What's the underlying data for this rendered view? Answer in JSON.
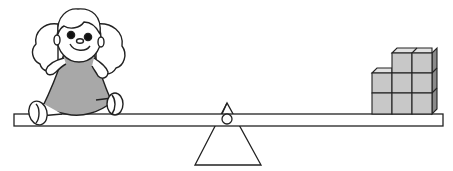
{
  "diagram": {
    "title": "Seesaw balance: doll vs. cubes",
    "colors": {
      "stroke": "#222222",
      "dress": "#a8a8a8",
      "cube_front": "#c8c8c8",
      "cube_top": "#e2e2e2",
      "cube_side": "#8a8a8a",
      "background": "#ffffff"
    },
    "objects": {
      "left": "doll",
      "right": "stack of cubes",
      "fulcrum": "triangle"
    },
    "cubes": {
      "count": 8,
      "layout": "3 columns front: bottom row 3, middle row 3, top row 2"
    }
  }
}
